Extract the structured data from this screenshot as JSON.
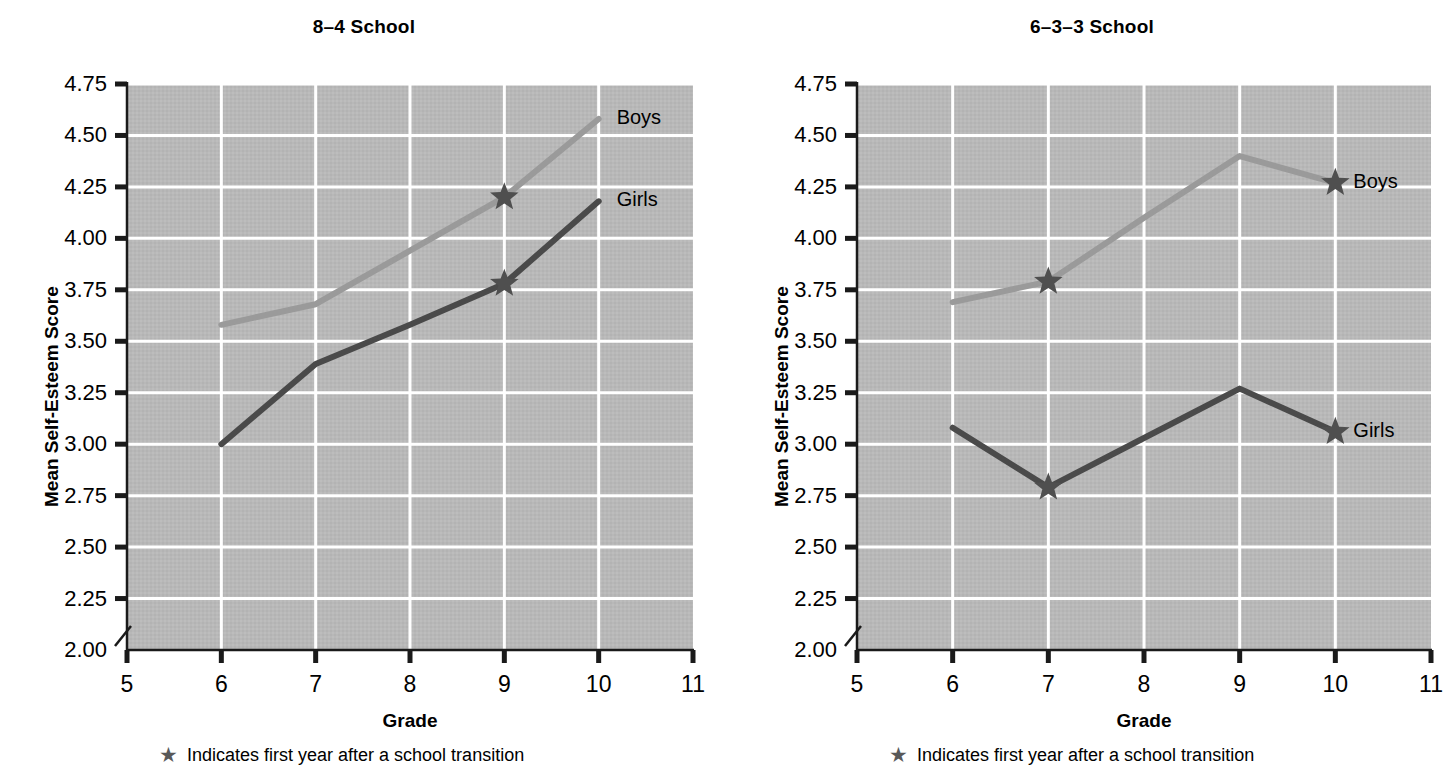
{
  "panels": [
    {
      "title": "8–4 School",
      "ylabel": "Mean Self-Esteem Score",
      "xlabel": "Grade",
      "footnote": "Indicates first year after a school transition",
      "footnote_icon": "star-icon",
      "boys_label": "Boys",
      "girls_label": "Girls"
    },
    {
      "title": "6–3–3 School",
      "ylabel": "Mean Self-Esteem Score",
      "xlabel": "Grade",
      "footnote": "Indicates first year after a school transition",
      "footnote_icon": "star-icon",
      "boys_label": "Boys",
      "girls_label": "Girls"
    }
  ],
  "ticks": {
    "y": [
      "4.75",
      "4.50",
      "4.25",
      "4.00",
      "3.75",
      "3.50",
      "3.25",
      "3.00",
      "2.75",
      "2.50",
      "2.25",
      "2.00"
    ],
    "x": [
      "5",
      "6",
      "7",
      "8",
      "9",
      "10",
      "11"
    ]
  },
  "colors": {
    "boys_line": "#9a9a9a",
    "girls_line": "#4a4a4a",
    "star": "#4f4f4f",
    "plot_background": "#b8b8b8",
    "gridline": "#ffffff",
    "axis": "#1a1a1a",
    "text": "#000000"
  },
  "chart_data": [
    {
      "type": "line",
      "title": "8–4 School",
      "xlabel": "Grade",
      "ylabel": "Mean Self-Esteem Score",
      "x": [
        6,
        7,
        8,
        9,
        10
      ],
      "xlim": [
        5,
        11
      ],
      "ylim": [
        2.0,
        4.75
      ],
      "xticks": [
        5,
        6,
        7,
        8,
        9,
        10,
        11
      ],
      "yticks": [
        2.0,
        2.25,
        2.5,
        2.75,
        3.0,
        3.25,
        3.5,
        3.75,
        4.0,
        4.25,
        4.5,
        4.75
      ],
      "y_axis_break": true,
      "grid": true,
      "legend": "inline-right-end-of-line",
      "series": [
        {
          "name": "Boys",
          "color": "#9a9a9a",
          "values": [
            3.58,
            3.68,
            3.94,
            4.2,
            4.58
          ],
          "transition_markers": [
            9
          ]
        },
        {
          "name": "Girls",
          "color": "#4a4a4a",
          "values": [
            3.0,
            3.39,
            3.58,
            3.78,
            4.18
          ],
          "transition_markers": [
            9
          ]
        }
      ],
      "annotations": [
        "★ Indicates first year after a school transition"
      ]
    },
    {
      "type": "line",
      "title": "6–3–3 School",
      "xlabel": "Grade",
      "ylabel": "Mean Self-Esteem Score",
      "x": [
        6,
        7,
        8,
        9,
        10
      ],
      "xlim": [
        5,
        11
      ],
      "ylim": [
        2.0,
        4.75
      ],
      "xticks": [
        5,
        6,
        7,
        8,
        9,
        10,
        11
      ],
      "yticks": [
        2.0,
        2.25,
        2.5,
        2.75,
        3.0,
        3.25,
        3.5,
        3.75,
        4.0,
        4.25,
        4.5,
        4.75
      ],
      "y_axis_break": true,
      "grid": true,
      "legend": "inline-right-end-of-line",
      "series": [
        {
          "name": "Boys",
          "color": "#9a9a9a",
          "values": [
            3.69,
            3.79,
            4.1,
            4.4,
            4.27
          ],
          "transition_markers": [
            7,
            10
          ]
        },
        {
          "name": "Girls",
          "color": "#4a4a4a",
          "values": [
            3.08,
            2.79,
            3.03,
            3.27,
            3.06
          ],
          "transition_markers": [
            7,
            10
          ]
        }
      ],
      "annotations": [
        "★ Indicates first year after a school transition"
      ]
    }
  ]
}
